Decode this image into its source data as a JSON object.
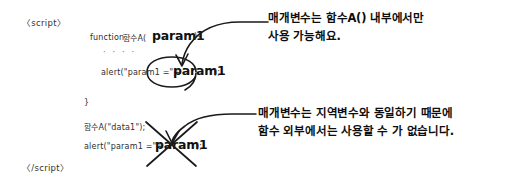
{
  "figure": {
    "kind": "handwritten-code-annotation-diagram",
    "background_color": "#ffffff",
    "ink_color": "#1a1a1a"
  },
  "code": {
    "script_open": "〈script〉",
    "script_close": "〈/script〉",
    "lines": [
      {
        "id": "fn-decl-prefix",
        "text": "function "
      },
      {
        "id": "fn-decl-name",
        "text": "함수A("
      },
      {
        "id": "fn-decl-param",
        "text": "param1"
      },
      {
        "id": "fn-decl-suffix",
        "text": "){"
      },
      {
        "id": "ellipsis",
        "text": "· · · ·"
      },
      {
        "id": "alert-inner-prefix",
        "text": "alert(\"param1 =\"+"
      },
      {
        "id": "alert-inner-param",
        "text": "param1"
      },
      {
        "id": "alert-inner-suffix",
        "text": ");"
      },
      {
        "id": "close-brace",
        "text": "}"
      },
      {
        "id": "fn-call",
        "text": "함수A(\"data1\");"
      },
      {
        "id": "alert-outer-prefix",
        "text": "alert(\"param1 =\"+"
      },
      {
        "id": "alert-outer-param",
        "text": "param1"
      },
      {
        "id": "alert-outer-suffix",
        "text": ");"
      }
    ]
  },
  "annotations": {
    "top_note": "매개변수는 함수A() 내부에서만\n사용 가능해요.",
    "bottom_note": "매개변수는 지역변수와 동일하기 때문에\n함수 외부에서는 사용할 수 가 없습니다."
  },
  "marks": {
    "highlight_ellipse_target": "param1",
    "strike_x_target": "param1",
    "arrow_top_label": "arrow-to-inner-param",
    "arrow_bottom_label": "arrow-to-outer-param"
  }
}
